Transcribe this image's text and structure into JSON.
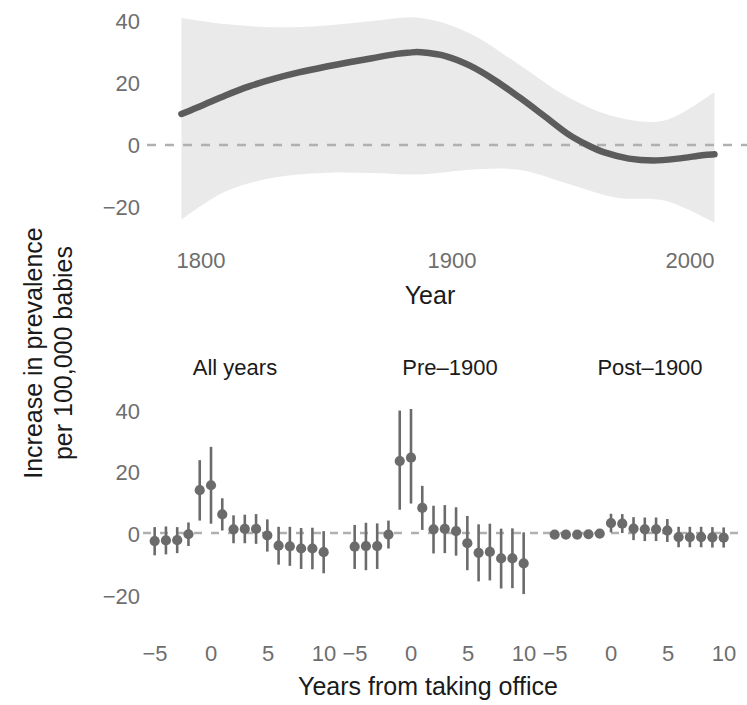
{
  "figure": {
    "y_axis_label_line1": "Increase in prevalence",
    "y_axis_label_line2": "per 100,000 babies"
  },
  "top_panel": {
    "x_axis_title": "Year",
    "x_ticks": [
      "1800",
      "1900",
      "2000"
    ],
    "y_ticks": [
      "40",
      "20",
      "0",
      "−20"
    ]
  },
  "bottom_panel": {
    "x_axis_title": "Years from taking office",
    "x_ticks": [
      "−5",
      "0",
      "5",
      "10"
    ],
    "y_ticks": [
      "40",
      "20",
      "0",
      "−20"
    ],
    "facets": [
      "All years",
      "Pre–1900",
      "Post–1900"
    ]
  },
  "colors": {
    "line": "#5c5c5c",
    "ribbon": "#e8e8e8",
    "point": "#6b6b6b",
    "errorbar": "#6b6b6b",
    "zeroline": "#b0b0b0",
    "tick_text": "#6e6e6e",
    "title_text": "#1a1a1a",
    "background": "#ffffff"
  },
  "chart_data": [
    {
      "type": "line",
      "id": "trend-over-time",
      "title": "",
      "xlabel": "Year",
      "ylabel": "Increase in prevalence per 100,000 babies",
      "xlim": [
        1790,
        2012
      ],
      "ylim": [
        -28,
        44
      ],
      "xticks": [
        1800,
        1900,
        2000
      ],
      "yticks": [
        -20,
        0,
        20,
        40
      ],
      "grid": false,
      "zero_reference_line": 0,
      "has_confidence_ribbon": true,
      "series": [
        {
          "name": "smoothed trend",
          "x": [
            1792,
            1800,
            1810,
            1820,
            1830,
            1840,
            1850,
            1860,
            1870,
            1880,
            1885,
            1890,
            1900,
            1910,
            1920,
            1930,
            1940,
            1950,
            1958,
            1965,
            1975,
            1985,
            1995,
            2005,
            2010
          ],
          "y": [
            10.0,
            12.6,
            16.0,
            19.0,
            21.4,
            23.4,
            25.1,
            26.6,
            28.0,
            29.4,
            29.8,
            29.9,
            28.7,
            25.6,
            21.0,
            15.5,
            9.6,
            3.6,
            0.0,
            -2.4,
            -4.4,
            -5.0,
            -4.4,
            -3.3,
            -3.0
          ]
        },
        {
          "name": "ribbon upper",
          "x": [
            1792,
            1810,
            1830,
            1850,
            1870,
            1890,
            1910,
            1930,
            1950,
            1970,
            1990,
            2010
          ],
          "y": [
            41.0,
            39.0,
            38.0,
            38.5,
            40.0,
            41.0,
            36.0,
            26.0,
            15.5,
            9.0,
            8.0,
            17.0
          ]
        },
        {
          "name": "ribbon lower",
          "x": [
            1792,
            1810,
            1830,
            1850,
            1870,
            1890,
            1910,
            1930,
            1950,
            1970,
            1990,
            2010
          ],
          "y": [
            -24.0,
            -15.0,
            -10.5,
            -9.0,
            -9.0,
            -9.5,
            -8.0,
            -8.0,
            -12.5,
            -17.0,
            -18.0,
            -25.0
          ]
        }
      ]
    },
    {
      "type": "scatter",
      "id": "event-study-all-years",
      "facet": "All years",
      "xlabel": "Years from taking office",
      "ylabel": "Increase in prevalence per 100,000 babies",
      "xlim": [
        -5.8,
        10.8
      ],
      "ylim": [
        -26,
        44
      ],
      "xticks": [
        -5,
        0,
        5,
        10
      ],
      "yticks": [
        -20,
        0,
        20,
        40
      ],
      "zero_reference_line": 0,
      "x": [
        -5,
        -4,
        -3,
        -2,
        -1,
        0,
        1,
        2,
        3,
        4,
        5,
        6,
        7,
        8,
        9,
        10
      ],
      "values": [
        -2.6,
        -2.4,
        -2.3,
        -0.4,
        13.8,
        15.4,
        6.0,
        1.2,
        1.3,
        1.3,
        -0.8,
        -4.1,
        -4.3,
        -5.0,
        -5.0,
        -6.2
      ],
      "error_low": [
        -7.2,
        -6.9,
        -6.5,
        -4.2,
        4.0,
        3.0,
        0.8,
        -3.3,
        -3.3,
        -3.5,
        -6.0,
        -10.2,
        -10.6,
        -11.6,
        -11.7,
        -13.0
      ],
      "error_high": [
        1.9,
        2.1,
        1.9,
        3.4,
        23.5,
        27.8,
        11.2,
        5.7,
        5.9,
        6.1,
        4.4,
        2.0,
        2.0,
        1.6,
        1.7,
        0.6
      ]
    },
    {
      "type": "scatter",
      "id": "event-study-pre-1900",
      "facet": "Pre–1900",
      "xlabel": "Years from taking office",
      "ylabel": "Increase in prevalence per 100,000 babies",
      "xlim": [
        -5.8,
        10.8
      ],
      "ylim": [
        -26,
        44
      ],
      "xticks": [
        -5,
        0,
        5,
        10
      ],
      "yticks": [
        -20,
        0,
        20,
        40
      ],
      "zero_reference_line": 0,
      "x": [
        -5,
        -4,
        -3,
        -2,
        -1,
        0,
        1,
        2,
        3,
        4,
        5,
        6,
        7,
        8,
        9,
        10
      ],
      "values": [
        -4.4,
        -4.2,
        -4.2,
        -0.5,
        23.2,
        24.3,
        8.1,
        1.2,
        1.3,
        0.6,
        -3.3,
        -6.4,
        -6.1,
        -8.2,
        -8.2,
        -9.8
      ],
      "error_low": [
        -11.6,
        -12.0,
        -11.6,
        -5.0,
        7.5,
        9.5,
        1.0,
        -6.6,
        -6.5,
        -7.3,
        -12.0,
        -15.6,
        -15.3,
        -17.9,
        -17.8,
        -19.7
      ],
      "error_high": [
        2.6,
        3.3,
        3.1,
        4.0,
        39.5,
        40.0,
        15.2,
        8.8,
        9.0,
        8.3,
        5.5,
        2.8,
        3.0,
        1.4,
        1.5,
        0.2
      ]
    },
    {
      "type": "scatter",
      "id": "event-study-post-1900",
      "facet": "Post–1900",
      "xlabel": "Years from taking office",
      "ylabel": "Increase in prevalence per 100,000 babies",
      "xlim": [
        -5.8,
        10.8
      ],
      "ylim": [
        -26,
        44
      ],
      "xticks": [
        -5,
        0,
        5,
        10
      ],
      "yticks": [
        -20,
        0,
        20,
        40
      ],
      "zero_reference_line": 0,
      "x": [
        -5,
        -4,
        -3,
        -2,
        -1,
        0,
        1,
        2,
        3,
        4,
        5,
        6,
        7,
        8,
        9,
        10
      ],
      "values": [
        -0.5,
        -0.5,
        -0.5,
        -0.4,
        -0.2,
        3.2,
        3.0,
        1.4,
        1.2,
        1.2,
        0.8,
        -1.3,
        -1.3,
        -1.3,
        -1.4,
        -1.5
      ],
      "error_low": [
        -1.4,
        -1.4,
        -1.4,
        -1.4,
        -1.2,
        0.2,
        0.0,
        -2.3,
        -2.6,
        -2.6,
        -2.9,
        -4.6,
        -4.6,
        -4.6,
        -4.7,
        -4.7
      ],
      "error_high": [
        0.5,
        0.5,
        0.5,
        0.6,
        0.8,
        6.2,
        6.1,
        5.1,
        5.0,
        5.0,
        4.5,
        2.0,
        2.0,
        2.0,
        1.9,
        1.8
      ]
    }
  ]
}
